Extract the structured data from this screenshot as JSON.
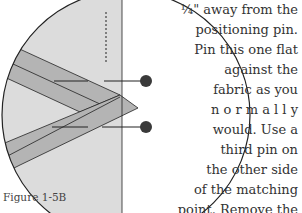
{
  "figure": {
    "caption": "Figure 1-5B",
    "colors": {
      "background_fabric": "#dcdcdc",
      "strip": "#b4b4b4",
      "outline": "#222222",
      "pin_head": "#3a3a3a"
    }
  },
  "body_text": {
    "lines": [
      "¼\" away from the",
      "positioning pin.",
      "Pin this one flat",
      "against the",
      "fabric as you",
      "n o r m a l l y",
      "would. Use a",
      "third pin on",
      "the other side",
      "of the matching",
      "point. Remove the",
      "positioning pin and sew"
    ]
  }
}
